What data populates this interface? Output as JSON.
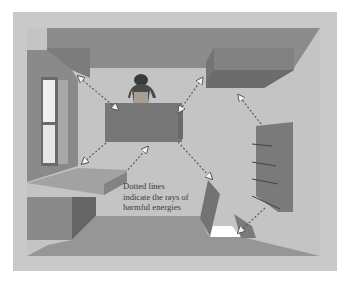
{
  "diagram": {
    "type": "room-floorplan-illustration",
    "view": "top-down",
    "caption": {
      "line1": "Dotted lines",
      "line2": "indicate the rays of",
      "line3": "harmful energies"
    },
    "elements": [
      "window",
      "person-at-desk",
      "desk",
      "top-right-cabinet",
      "right-bookshelf",
      "left-bench",
      "bottom-left-cabinet",
      "tilted-panel",
      "floor-opening",
      "corner-wedge"
    ],
    "arrows": [
      {
        "from": "top-left-corner",
        "to": "desk",
        "bidirectional": true
      },
      {
        "from": "desk",
        "to": "top-right-cabinet-corner",
        "bidirectional": true
      },
      {
        "from": "right-bookshelf",
        "to": "room-center",
        "bidirectional": false
      },
      {
        "from": "desk",
        "to": "left-bench",
        "bidirectional": false
      },
      {
        "from": "bench-edge",
        "to": "desk",
        "bidirectional": false
      },
      {
        "from": "desk",
        "to": "tilted-panel",
        "bidirectional": false
      },
      {
        "from": "right-bookshelf",
        "to": "corner-wedge",
        "bidirectional": false
      }
    ],
    "colors": {
      "background": "#ffffff",
      "frame": "#c9c9c9",
      "floor": "#c2c2c2",
      "wall": "#8e8e8e",
      "wall_dark": "#6f6f6f",
      "desk": "#777777",
      "arrow": "#555555"
    }
  }
}
